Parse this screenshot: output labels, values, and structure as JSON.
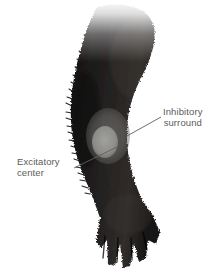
{
  "figure": {
    "background_color": "#ffffff",
    "body_color": "#1b1a18",
    "body_color_mid": "#2a2724",
    "fade_color": "#ffffff"
  },
  "annotations": [
    {
      "id": "inhibitory",
      "line1": "Inhibitory",
      "line2": "surround",
      "text_color": "#5b5b5b",
      "leader": {
        "x1": 161,
        "y1": 117,
        "x2": 127,
        "y2": 136
      },
      "target_color": "#6e6e6c"
    },
    {
      "id": "excitatory",
      "line1": "Excitatory",
      "line2": "center",
      "text_color": "#5b5b5b",
      "leader": {
        "x1": 74,
        "y1": 168,
        "x2": 117,
        "y2": 147
      },
      "target_color": "#9a9a96"
    }
  ],
  "receptive_field": {
    "surround": {
      "label": "inhibitory-surround",
      "cx": 108,
      "cy": 136,
      "rx": 22,
      "ry": 28,
      "color": "#6e6e6c",
      "opacity": 0.55
    },
    "center": {
      "label": "excitatory-center",
      "cx": 105,
      "cy": 142,
      "rx": 13,
      "ry": 16,
      "color": "#a6a6a2",
      "opacity": 0.72
    }
  }
}
